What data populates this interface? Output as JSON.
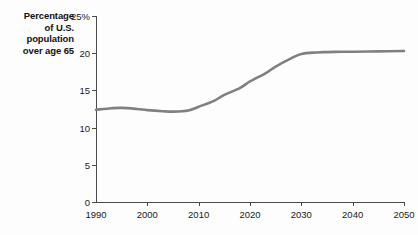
{
  "chart_data": {
    "type": "line",
    "title": "Percentage of U.S. population over age 65",
    "title_lines": [
      "Percentage",
      "of U.S.",
      "population",
      "over age 65"
    ],
    "xlabel": "",
    "ylabel": "Percentage of U.S. population over age 65",
    "xlim": [
      1990,
      2050
    ],
    "ylim": [
      0,
      25
    ],
    "grid": false,
    "legend": "none",
    "line_color": "#808080",
    "axis_color": "#4a4a4a",
    "background": "#fdfdfd",
    "xticks": [
      1990,
      2000,
      2010,
      2020,
      2030,
      2040,
      2050
    ],
    "xtick_labels": [
      "1990",
      "2000",
      "2010",
      "2020",
      "2030",
      "2040",
      "2050"
    ],
    "yticks": [
      0,
      5,
      10,
      15,
      20,
      25
    ],
    "ytick_labels": [
      "0",
      "5",
      "10",
      "15",
      "20",
      "25%"
    ],
    "series": [
      {
        "name": "Percentage of U.S. population over age 65",
        "x": [
          1990,
          1993,
          1995,
          1998,
          2000,
          2003,
          2005,
          2008,
          2010,
          2013,
          2015,
          2018,
          2020,
          2023,
          2025,
          2028,
          2030,
          2033,
          2035,
          2038,
          2040,
          2045,
          2050
        ],
        "values": [
          12.4,
          12.6,
          12.65,
          12.5,
          12.35,
          12.2,
          12.15,
          12.3,
          12.8,
          13.6,
          14.4,
          15.3,
          16.2,
          17.3,
          18.2,
          19.3,
          19.9,
          20.1,
          20.15,
          20.2,
          20.2,
          20.25,
          20.3
        ]
      }
    ]
  }
}
